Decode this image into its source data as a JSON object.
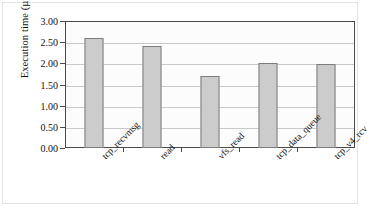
{
  "chart_data": {
    "type": "bar",
    "title": "",
    "subtitle": "",
    "xlabel": "",
    "ylabel": "Execution time (µs)",
    "categories": [
      "tcp_recvmsg",
      "read",
      "vfs_read",
      "tcp_data_queue",
      "tcp_v4_rcv"
    ],
    "values": [
      2.6,
      2.4,
      1.7,
      2.01,
      1.98
    ],
    "ylim": [
      0.0,
      3.0
    ],
    "ytick_step": 0.5,
    "ytick_labels": [
      "0.00",
      "0.50",
      "1.00",
      "1.50",
      "2.00",
      "2.50",
      "3.00"
    ],
    "ytick_values": [
      0.0,
      0.5,
      1.0,
      1.5,
      2.0,
      2.5,
      3.0
    ],
    "grid": "horizontal",
    "legend": "none",
    "series": [
      {
        "name": "Execution time",
        "values": [
          2.6,
          2.4,
          1.7,
          2.01,
          1.98
        ]
      }
    ],
    "annotations": [],
    "xlabel_rotation_deg": -45,
    "colors": {
      "bar_fill": "#cccccc",
      "bar_edge": "#7d7d7d",
      "axis": "#4a4a4a",
      "gridline": "#c9c9c9",
      "text": "#111111",
      "plot_background": "#fcfcfc",
      "figure_background": "#ffffff",
      "figure_border": "#e3e3e3"
    }
  }
}
